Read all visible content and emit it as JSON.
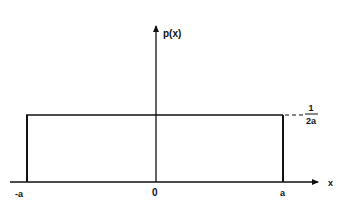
{
  "diagram": {
    "y_axis_label": "p(x)",
    "x_axis_label": "x",
    "tick_labels": {
      "left": "-a",
      "origin": "0",
      "right": "a"
    },
    "height_label": {
      "numerator": "1",
      "denominator": "2a"
    },
    "colors": {
      "line": "#111111",
      "background": "#ffffff"
    }
  }
}
